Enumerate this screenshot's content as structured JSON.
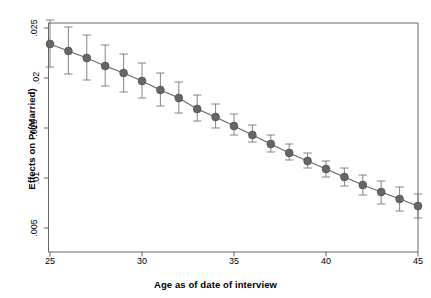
{
  "chart_data": {
    "type": "line",
    "title": "",
    "subtitle": "",
    "xlabel": "Age as of date of interview",
    "ylabel": "Effects on Pr(Married)",
    "xlim": [
      24,
      46
    ],
    "ylim": [
      0.005,
      0.025
    ],
    "grid": false,
    "legend": null,
    "marker": "filled-circle",
    "error_bars": "95% confidence interval",
    "x": [
      25,
      26,
      27,
      28,
      29,
      30,
      31,
      32,
      33,
      34,
      35,
      36,
      37,
      38,
      39,
      40,
      41,
      42,
      43,
      44,
      45
    ],
    "values": [
      0.0234,
      0.0227,
      0.022,
      0.0212,
      0.0205,
      0.0197,
      0.0188,
      0.018,
      0.0169,
      0.0161,
      0.0152,
      0.0143,
      0.0134,
      0.0125,
      0.0117,
      0.0109,
      0.0101,
      0.0093,
      0.0086,
      0.0079,
      0.0072
    ],
    "ci_low": [
      0.0211,
      0.0204,
      0.0198,
      0.0192,
      0.0186,
      0.018,
      0.0172,
      0.0165,
      0.0157,
      0.015,
      0.0143,
      0.0136,
      0.0126,
      0.0118,
      0.011,
      0.0101,
      0.0092,
      0.0083,
      0.0074,
      0.0067,
      0.006
    ],
    "ci_high": [
      0.0258,
      0.0251,
      0.0243,
      0.0233,
      0.0224,
      0.0215,
      0.0205,
      0.0196,
      0.0183,
      0.0174,
      0.0164,
      0.0153,
      0.0143,
      0.0134,
      0.0125,
      0.0117,
      0.011,
      0.0103,
      0.0097,
      0.0091,
      0.0084
    ],
    "xticks": [
      25,
      30,
      35,
      40,
      45
    ],
    "xtick_labels": [
      "25",
      "30",
      "35",
      "40",
      "45"
    ],
    "yticks": [
      0.005,
      0.01,
      0.015,
      0.02,
      0.025
    ],
    "ytick_labels": [
      ".005",
      ".01",
      ".015",
      ".02",
      ".025"
    ],
    "colors": {
      "marker": "#666666",
      "line": "#666666",
      "error_bar": "#777777",
      "axis": "#555555",
      "background": "#ffffff",
      "text": "#000000"
    }
  }
}
